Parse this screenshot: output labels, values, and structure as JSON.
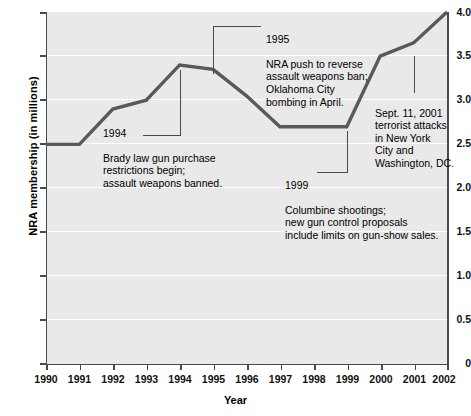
{
  "chart_data": {
    "type": "line",
    "title": "",
    "xlabel": "Year",
    "ylabel": "NRA membership (in millions)",
    "xlim": [
      1990,
      2002
    ],
    "ylim": [
      0,
      4.0
    ],
    "grid": true,
    "legend": "none",
    "x": [
      1990,
      1991,
      1992,
      1993,
      1994,
      1995,
      1996,
      1997,
      1998,
      1999,
      2000,
      2001,
      2002
    ],
    "values": [
      2.5,
      2.5,
      2.9,
      3.0,
      3.4,
      3.35,
      3.05,
      2.7,
      2.7,
      2.7,
      3.5,
      3.65,
      4.0
    ],
    "series": [
      {
        "name": "NRA membership",
        "values": [
          2.5,
          2.5,
          2.9,
          3.0,
          3.4,
          3.35,
          3.05,
          2.7,
          2.7,
          2.7,
          3.5,
          3.65,
          4.0
        ]
      }
    ],
    "ytick_labels": [
      "4.0",
      "3.5",
      "3.0",
      "2.5",
      "2.0",
      "1.5",
      "1.0",
      "0.5",
      "0"
    ],
    "ytick_values": [
      4.0,
      3.5,
      3.0,
      2.5,
      2.0,
      1.5,
      1.0,
      0.5,
      0
    ],
    "xtick_labels": [
      "1990",
      "1991",
      "1992",
      "1993",
      "1994",
      "1995",
      "1996",
      "1997",
      "1998",
      "1999",
      "2000",
      "2001",
      "2002"
    ],
    "line_color": "#595959",
    "plot_background": "#e9e9e9",
    "gridline_color": "#ffffff",
    "annotations": [
      {
        "id": "a1994",
        "year": "1994",
        "text": "Brady law gun purchase\nrestrictions begin;\nassault weapons banned.",
        "anchor_x": 1994,
        "anchor_y": 3.4
      },
      {
        "id": "a1995",
        "year": "1995",
        "text": "NRA push to reverse\nassault weapons ban;\nOklahoma City\nbombing in April.",
        "anchor_x": 1995,
        "anchor_y": 3.35
      },
      {
        "id": "a2001",
        "year": "",
        "text": "Sept. 11, 2001\nterrorist attacks\nin New York\nCity and\nWashington, DC.",
        "anchor_x": 2001,
        "anchor_y": 3.65
      },
      {
        "id": "a1999",
        "year": "1999",
        "text": "Columbine shootings;\nnew gun control proposals\ninclude limits on gun-show sales.",
        "anchor_x": 1999,
        "anchor_y": 2.7
      }
    ]
  }
}
